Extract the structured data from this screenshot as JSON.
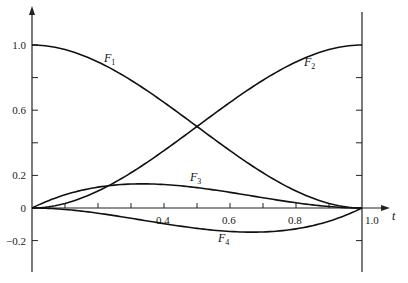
{
  "chart_data": {
    "type": "line",
    "title": "",
    "xlabel": "t",
    "ylabel": "",
    "xlim": [
      0,
      1.0
    ],
    "ylim": [
      -0.2,
      1.0
    ],
    "grid": false,
    "legend": "inline curve labels",
    "x_tick_labels": [
      "0.4",
      "0.6",
      "0.8",
      "1.0"
    ],
    "y_tick_labels": [
      "1.0",
      "0.6",
      "0.2",
      "0",
      "-0.2"
    ],
    "x": [
      0,
      0.1,
      0.2,
      0.3,
      0.4,
      0.5,
      0.6,
      0.7,
      0.8,
      0.9,
      1.0
    ],
    "series": [
      {
        "name": "F1",
        "label_main": "F",
        "label_sub": "1",
        "values": [
          1.0,
          0.972,
          0.896,
          0.784,
          0.648,
          0.5,
          0.352,
          0.216,
          0.104,
          0.028,
          0.0
        ]
      },
      {
        "name": "F2",
        "label_main": "F",
        "label_sub": "2",
        "values": [
          0.0,
          0.028,
          0.104,
          0.216,
          0.352,
          0.5,
          0.648,
          0.784,
          0.896,
          0.972,
          1.0
        ]
      },
      {
        "name": "F3",
        "label_main": "F",
        "label_sub": "3",
        "values": [
          0.0,
          0.081,
          0.128,
          0.147,
          0.144,
          0.125,
          0.096,
          0.063,
          0.032,
          0.009,
          0.0
        ]
      },
      {
        "name": "F4",
        "label_main": "F",
        "label_sub": "4",
        "values": [
          0.0,
          -0.009,
          -0.032,
          -0.063,
          -0.096,
          -0.125,
          -0.144,
          -0.147,
          -0.128,
          -0.081,
          0.0
        ]
      }
    ]
  }
}
